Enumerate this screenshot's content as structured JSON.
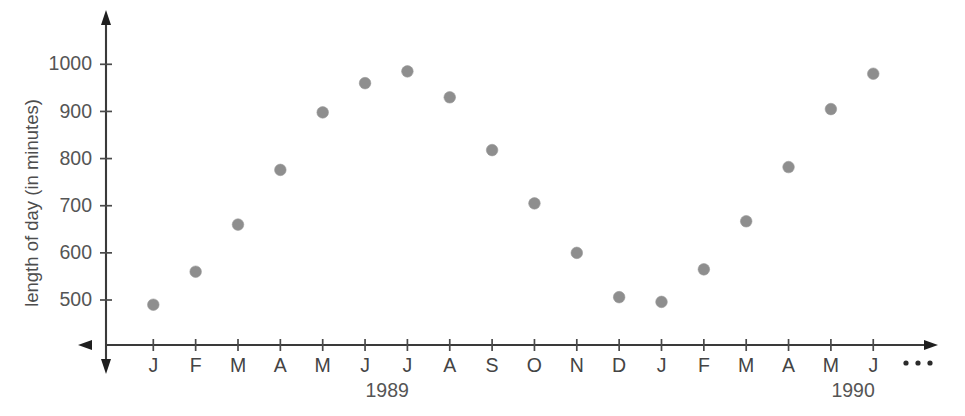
{
  "chart_data": {
    "type": "scatter",
    "title": "",
    "xlabel": "",
    "ylabel": "length of day (in minutes)",
    "categories": [
      "J",
      "F",
      "M",
      "A",
      "M",
      "J",
      "J",
      "A",
      "S",
      "O",
      "N",
      "D",
      "J",
      "F",
      "M",
      "A",
      "M",
      "J"
    ],
    "x_tick_labels": [
      "J",
      "F",
      "M",
      "A",
      "M",
      "J",
      "J",
      "A",
      "S",
      "O",
      "N",
      "D",
      "J",
      "F",
      "M",
      "A",
      "M",
      "J"
    ],
    "y_tick_labels": [
      "500",
      "600",
      "700",
      "800",
      "900",
      "1000"
    ],
    "y_ticks": [
      500,
      600,
      700,
      800,
      900,
      1000
    ],
    "ylim": [
      430,
      1060
    ],
    "grid": false,
    "legend": null,
    "trailing_marker": "• • •",
    "group_labels": [
      {
        "text": "1989",
        "center_index": 5.5
      },
      {
        "text": "1990",
        "center_index": 16.5
      }
    ],
    "points": [
      {
        "label": "J",
        "year": "1989",
        "index": 0,
        "value": 490
      },
      {
        "label": "F",
        "year": "1989",
        "index": 1,
        "value": 560
      },
      {
        "label": "M",
        "year": "1989",
        "index": 2,
        "value": 660
      },
      {
        "label": "A",
        "year": "1989",
        "index": 3,
        "value": 776
      },
      {
        "label": "M",
        "year": "1989",
        "index": 4,
        "value": 898
      },
      {
        "label": "J",
        "year": "1989",
        "index": 5,
        "value": 960
      },
      {
        "label": "J",
        "year": "1989",
        "index": 6,
        "value": 985
      },
      {
        "label": "A",
        "year": "1989",
        "index": 7,
        "value": 930
      },
      {
        "label": "S",
        "year": "1989",
        "index": 8,
        "value": 818
      },
      {
        "label": "O",
        "year": "1989",
        "index": 9,
        "value": 705
      },
      {
        "label": "N",
        "year": "1989",
        "index": 10,
        "value": 600
      },
      {
        "label": "D",
        "year": "1989",
        "index": 11,
        "value": 506
      },
      {
        "label": "J",
        "year": "1990",
        "index": 12,
        "value": 496
      },
      {
        "label": "F",
        "year": "1990",
        "index": 13,
        "value": 565
      },
      {
        "label": "M",
        "year": "1990",
        "index": 14,
        "value": 667
      },
      {
        "label": "A",
        "year": "1990",
        "index": 15,
        "value": 782
      },
      {
        "label": "M",
        "year": "1990",
        "index": 16,
        "value": 905
      },
      {
        "label": "J",
        "year": "1990",
        "index": 17,
        "value": 980
      }
    ],
    "values": [
      490,
      560,
      660,
      776,
      898,
      960,
      985,
      930,
      818,
      705,
      600,
      506,
      496,
      565,
      667,
      782,
      905,
      980
    ],
    "marker_color": "#8e8e8e",
    "axis_color": "#3a3a3a"
  }
}
